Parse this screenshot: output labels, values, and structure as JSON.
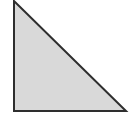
{
  "diagram": {
    "shape": "right-triangle",
    "vertices": [
      [
        14,
        1
      ],
      [
        14,
        111
      ],
      [
        126,
        111
      ]
    ],
    "fill": "#d9d9d9",
    "stroke": "#2e2e2e",
    "stroke_width": 2
  }
}
